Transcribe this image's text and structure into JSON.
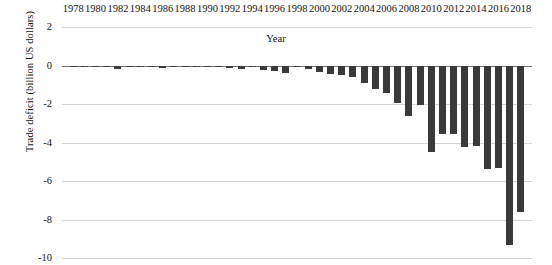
{
  "chart_data": {
    "type": "bar",
    "title": "",
    "xlabel": "Year",
    "ylabel": "Trade deficit (billion US dollars)",
    "xlim": [
      1977,
      2019
    ],
    "ylim": [
      -10,
      2
    ],
    "grid": true,
    "legend": "none",
    "x_axis_position": "top",
    "bar_color": "#3a3a3a",
    "gridline_color": "#d2d2d2",
    "zero_line_color": "#6f6f6f",
    "y_ticks": [
      2,
      0,
      -2,
      -4,
      -6,
      -8,
      -10
    ],
    "y_tick_labels": [
      "2",
      "0",
      "-2",
      "-4",
      "-6",
      "-8",
      "-10"
    ],
    "x_tick_labels": [
      "1978",
      "1980",
      "1982",
      "1984",
      "1986",
      "1988",
      "1990",
      "1992",
      "1994",
      "1996",
      "1998",
      "2000",
      "2002",
      "2004",
      "2006",
      "2008",
      "2010",
      "2012",
      "2014",
      "2016",
      "2018"
    ],
    "x_tick_values": [
      1978,
      1980,
      1982,
      1984,
      1986,
      1988,
      1990,
      1992,
      1994,
      1996,
      1998,
      2000,
      2002,
      2004,
      2006,
      2008,
      2010,
      2012,
      2014,
      2016,
      2018
    ],
    "categories": [
      1978,
      1979,
      1980,
      1981,
      1982,
      1983,
      1984,
      1985,
      1986,
      1987,
      1988,
      1989,
      1990,
      1991,
      1992,
      1993,
      1994,
      1995,
      1996,
      1997,
      1998,
      1999,
      2000,
      2001,
      2002,
      2003,
      2004,
      2005,
      2006,
      2007,
      2008,
      2009,
      2010,
      2011,
      2012,
      2013,
      2014,
      2015,
      2016,
      2017,
      2018
    ],
    "values": [
      -0.05,
      -0.03,
      -0.04,
      -0.06,
      -0.18,
      -0.05,
      -0.04,
      -0.05,
      -0.12,
      -0.1,
      -0.07,
      -0.06,
      -0.05,
      -0.04,
      -0.12,
      -0.16,
      -0.1,
      -0.22,
      -0.3,
      -0.38,
      -0.08,
      -0.2,
      -0.32,
      -0.42,
      -0.5,
      -0.62,
      -0.9,
      -1.2,
      -1.45,
      -1.95,
      -2.6,
      -2.05,
      -4.5,
      -3.55,
      -3.55,
      -4.25,
      -4.2,
      -5.4,
      -5.3,
      -9.35,
      -7.6
    ]
  }
}
